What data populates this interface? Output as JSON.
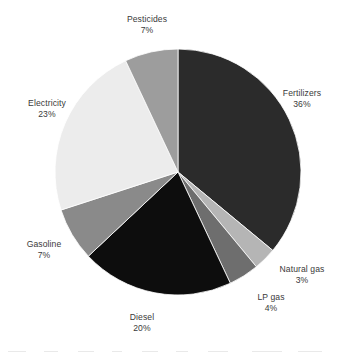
{
  "chart_data": {
    "type": "pie",
    "title": "",
    "subtitle": "",
    "xlabel": "",
    "ylabel": "",
    "units": "percent",
    "legend_position": "none",
    "labels_position": "outside-callout",
    "grid": false,
    "start_angle_deg": 0,
    "direction": "clockwise",
    "categories": [
      "Fertilizers",
      "Natural gas",
      "LP gas",
      "Diesel",
      "Gasoline",
      "Electricity",
      "Pesticides"
    ],
    "values": [
      36,
      3,
      4,
      20,
      7,
      23,
      7
    ],
    "slices": [
      {
        "name": "Fertilizers",
        "value": 36,
        "value_text": "36%",
        "color": "#2b2b2b"
      },
      {
        "name": "Natural gas",
        "value": 3,
        "value_text": "3%",
        "color": "#b5b5b5"
      },
      {
        "name": "LP gas",
        "value": 4,
        "value_text": "4%",
        "color": "#6e6e6e"
      },
      {
        "name": "Diesel",
        "value": 20,
        "value_text": "20%",
        "color": "#0d0d0d"
      },
      {
        "name": "Gasoline",
        "value": 7,
        "value_text": "7%",
        "color": "#8a8a8a"
      },
      {
        "name": "Electricity",
        "value": 23,
        "value_text": "23%",
        "color": "#ececec"
      },
      {
        "name": "Pesticides",
        "value": 7,
        "value_text": "7%",
        "color": "#9d9d9d"
      }
    ]
  },
  "geometry": {
    "center_x": 178,
    "center_y": 172,
    "radius": 123
  },
  "style": {
    "background": "#ffffff",
    "label_color": "#3a3a3a",
    "slice_stroke": "#ffffff"
  }
}
